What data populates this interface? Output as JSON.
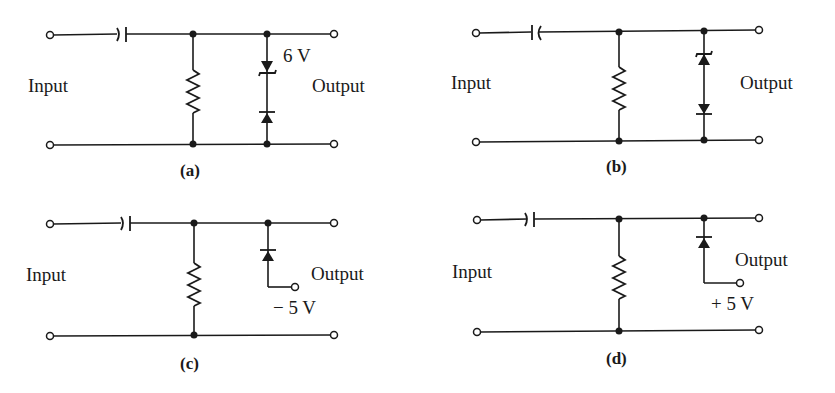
{
  "figure": {
    "panels": [
      {
        "id": "a",
        "caption": "(a)",
        "input_label": "Input",
        "output_label": "Output",
        "component_label": "6 V",
        "components": [
          "series-capacitor",
          "shunt-resistor",
          "zener-diode-6V",
          "diode-in-series-with-zener"
        ],
        "description": "Series capacitor, shunt resistor, 6 V zener (cathode up) in series with diode (cathode up) across output"
      },
      {
        "id": "b",
        "caption": "(b)",
        "input_label": "Input",
        "output_label": "Output",
        "component_label": "",
        "components": [
          "series-capacitor",
          "shunt-resistor",
          "zener-diode",
          "diode-in-series-with-zener"
        ],
        "description": "Series capacitor, shunt resistor, zener (cathode up, triangle up) in series with diode (pointing down) across output"
      },
      {
        "id": "c",
        "caption": "(c)",
        "input_label": "Input",
        "output_label": "Output",
        "component_label": "− 5 V",
        "components": [
          "series-capacitor",
          "shunt-resistor",
          "diode-to-bias-terminal"
        ],
        "description": "Series capacitor, shunt resistor, diode (cathode to top rail) connected to -5 V bias terminal"
      },
      {
        "id": "d",
        "caption": "(d)",
        "input_label": "Input",
        "output_label": "Output",
        "component_label": "+ 5 V",
        "components": [
          "series-capacitor",
          "shunt-resistor",
          "diode-to-bias-terminal"
        ],
        "description": "Series capacitor, shunt resistor, diode (cathode to top rail) connected to +5 V bias terminal"
      }
    ]
  },
  "colors": {
    "ink": "#1a1a1a",
    "background": "#ffffff"
  }
}
